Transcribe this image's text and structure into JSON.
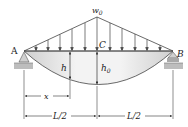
{
  "diagram": {
    "load_label": "w",
    "load_subscript": "0",
    "point_labels": {
      "left_support": "A",
      "right_support": "B",
      "midspan": "C"
    },
    "height_labels": {
      "h": "h",
      "h0_main": "h",
      "h0_sub": "0"
    },
    "dimensions": {
      "x": "x",
      "left_half": "L/2",
      "right_half": "L/2"
    },
    "supports": {
      "left": "pin",
      "right": "roller"
    },
    "load_shape": "triangular",
    "colors": {
      "line": "#333333",
      "arch_fill_light": "#f2f2f2",
      "arch_fill_dark": "#c8c8c8",
      "ground": "#bdbdbd"
    }
  }
}
